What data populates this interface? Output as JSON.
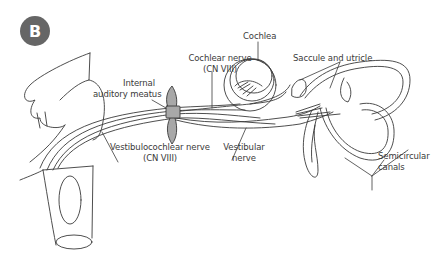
{
  "figure": {
    "panel_label": "B",
    "badge_color": "#666666",
    "line_color": "#3a3a3a",
    "meatus_fill": "#a8a8a8"
  },
  "labels": {
    "cochlea": "Cochlea",
    "cochlear_nerve": [
      "Cochlear nerve",
      "(CN VIII)"
    ],
    "saccule_utricle": "Saccule and utricle",
    "internal_meatus": [
      "Internal",
      "auditory meatus"
    ],
    "vestibulocochlear_nerve": [
      "Vestibulocochlear nerve",
      "(CN VIII)"
    ],
    "vestibular_nerve": [
      "Vestibular",
      "nerve"
    ],
    "semicircular_canals": [
      "Semicircular",
      "canals"
    ]
  }
}
